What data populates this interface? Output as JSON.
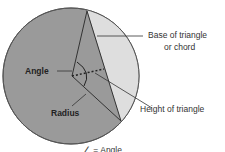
{
  "diagram": {
    "labels": {
      "base": "Base of triangle",
      "base2": "or chord",
      "angle": "Angle",
      "radius": "Radius",
      "height": "Height of triangle",
      "legend": "∠ = Angle"
    },
    "colors": {
      "sector": "#9a9a9a",
      "segment": "#dedede",
      "outline": "#333333"
    }
  }
}
